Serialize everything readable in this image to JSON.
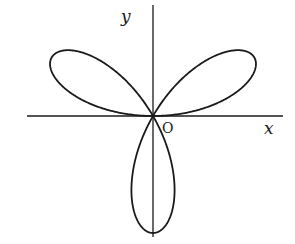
{
  "diagram": {
    "type": "polar-rose-curve",
    "petals": 3,
    "petal_directions_deg": [
      30,
      150,
      270
    ],
    "labels": {
      "x_axis": "x",
      "y_axis": "y",
      "origin": "O"
    },
    "colors": {
      "curve": "#1a1a1a",
      "axes": "#1a1a1a",
      "background": "#ffffff"
    }
  }
}
